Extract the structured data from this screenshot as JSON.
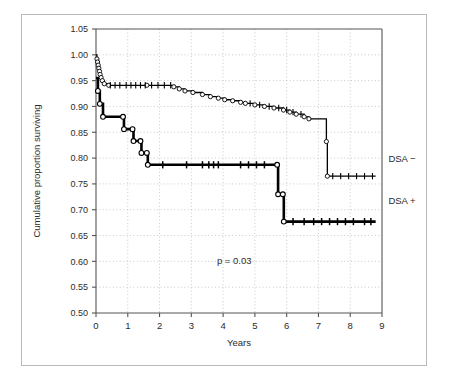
{
  "figure": {
    "background_color": "#ffffff",
    "border_color": "#b9b9b9",
    "grid_color": "#bdbdbd",
    "axis_color": "#555555",
    "curve_color": "#000000"
  },
  "axis": {
    "y_label": "Cumulative proportion surviving",
    "x_label": "Years",
    "y_ticks": [
      "1.05",
      "1.00",
      "0.95",
      "0.90",
      "0.85",
      "0.80",
      "0.75",
      "0.70",
      "0.65",
      "0.60",
      "0.55",
      "0.50"
    ],
    "x_ticks": [
      "0",
      "1",
      "2",
      "3",
      "4",
      "5",
      "6",
      "7",
      "8",
      "9"
    ]
  },
  "annotations": {
    "p_value": "p = 0.03",
    "legend_upper": "DSA −",
    "legend_lower": "DSA +"
  },
  "chart_data": {
    "type": "line",
    "subtype": "kaplan-meier-survival",
    "title": "",
    "xlabel": "Years",
    "ylabel": "Cumulative proportion surviving",
    "xlim": [
      0,
      9
    ],
    "ylim": [
      0.5,
      1.05
    ],
    "x_ticks": [
      0,
      1,
      2,
      3,
      4,
      5,
      6,
      7,
      8,
      9
    ],
    "y_ticks": [
      0.5,
      0.55,
      0.6,
      0.65,
      0.7,
      0.75,
      0.8,
      0.85,
      0.9,
      0.95,
      1.0,
      1.05
    ],
    "grid": true,
    "grid_style": "dotted",
    "legend_position": "right-inside",
    "p_value": 0.03,
    "series": [
      {
        "name": "DSA −",
        "line_style": "thin-with-censor-ticks",
        "marker": "open-circle",
        "steps": [
          [
            0.0,
            1.0
          ],
          [
            0.03,
            0.992
          ],
          [
            0.05,
            0.986
          ],
          [
            0.07,
            0.98
          ],
          [
            0.09,
            0.974
          ],
          [
            0.11,
            0.968
          ],
          [
            0.13,
            0.962
          ],
          [
            0.16,
            0.956
          ],
          [
            0.2,
            0.95
          ],
          [
            0.26,
            0.944
          ],
          [
            0.4,
            0.941
          ],
          [
            1.6,
            0.941
          ],
          [
            2.45,
            0.938
          ],
          [
            2.62,
            0.934
          ],
          [
            2.8,
            0.93
          ],
          [
            3.05,
            0.927
          ],
          [
            3.35,
            0.923
          ],
          [
            3.6,
            0.919
          ],
          [
            3.85,
            0.916
          ],
          [
            4.05,
            0.913
          ],
          [
            4.3,
            0.911
          ],
          [
            4.55,
            0.908
          ],
          [
            4.7,
            0.906
          ],
          [
            5.0,
            0.903
          ],
          [
            5.3,
            0.9
          ],
          [
            5.6,
            0.897
          ],
          [
            5.9,
            0.893
          ],
          [
            6.1,
            0.889
          ],
          [
            6.3,
            0.885
          ],
          [
            6.55,
            0.88
          ],
          [
            6.7,
            0.876
          ],
          [
            7.25,
            0.832
          ],
          [
            7.28,
            0.765
          ],
          [
            8.8,
            0.765
          ]
        ],
        "censor_times": [
          0.45,
          0.6,
          0.75,
          0.95,
          1.1,
          1.25,
          1.4,
          1.55,
          1.75,
          1.95,
          2.15,
          2.35,
          4.85,
          5.15,
          5.45,
          5.75,
          6.0,
          6.2,
          6.45,
          7.45,
          7.7,
          7.95,
          8.2,
          8.45,
          8.7
        ]
      },
      {
        "name": "DSA +",
        "line_style": "thick-with-censor-ticks",
        "marker": "open-circle",
        "steps": [
          [
            0.0,
            0.955
          ],
          [
            0.06,
            0.93
          ],
          [
            0.12,
            0.905
          ],
          [
            0.22,
            0.88
          ],
          [
            0.85,
            0.88
          ],
          [
            0.88,
            0.856
          ],
          [
            1.15,
            0.856
          ],
          [
            1.18,
            0.833
          ],
          [
            1.4,
            0.833
          ],
          [
            1.43,
            0.81
          ],
          [
            1.6,
            0.81
          ],
          [
            1.63,
            0.787
          ],
          [
            5.7,
            0.787
          ],
          [
            5.73,
            0.73
          ],
          [
            5.88,
            0.73
          ],
          [
            5.91,
            0.677
          ],
          [
            8.8,
            0.677
          ]
        ],
        "censor_times": [
          2.1,
          2.85,
          3.35,
          3.55,
          3.7,
          3.85,
          4.55,
          4.8,
          5.05,
          5.3,
          6.2,
          6.55,
          6.85,
          7.1,
          7.35,
          7.6,
          7.85,
          8.1,
          8.45,
          8.65
        ]
      }
    ]
  }
}
